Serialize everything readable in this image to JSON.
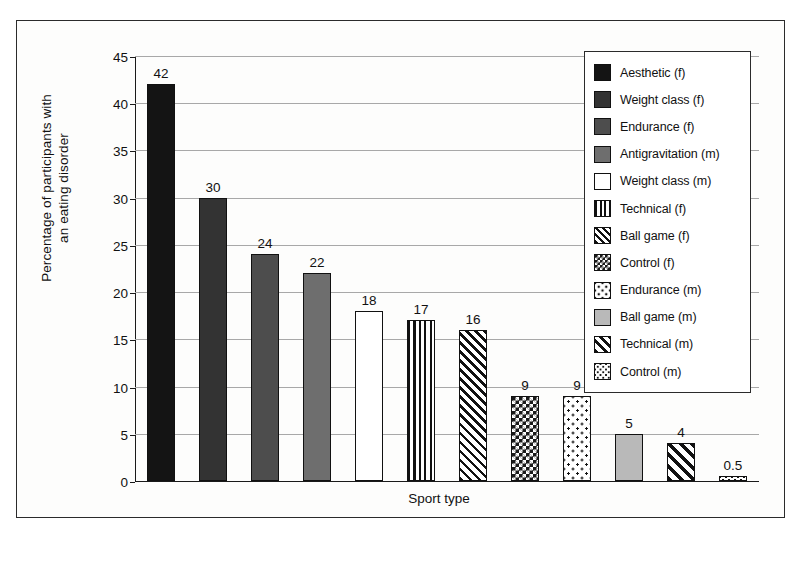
{
  "chart_data": {
    "type": "bar",
    "title": "",
    "xlabel": "Sport type",
    "ylabel": "Percentage of participants with\nan eating disorder",
    "ylim": [
      0,
      45
    ],
    "ytick_step": 5,
    "yticks": [
      0,
      5,
      10,
      15,
      20,
      25,
      30,
      35,
      40,
      45
    ],
    "grid": true,
    "legend_position": "top-right-inside",
    "categories": [
      "Aesthetic (f)",
      "Weight class (f)",
      "Endurance (f)",
      "Antigravitation (m)",
      "Weight class (m)",
      "Technical (f)",
      "Ball game (f)",
      "Control (f)",
      "Endurance (m)",
      "Ball game (m)",
      "Technical (m)",
      "Control (m)"
    ],
    "values": [
      42,
      30,
      24,
      22,
      18,
      17,
      16,
      9,
      9,
      5,
      4,
      0.5
    ],
    "value_labels": [
      "42",
      "30",
      "24",
      "22",
      "18",
      "17",
      "16",
      "9",
      "9",
      "5",
      "4",
      "0.5"
    ],
    "patterns": [
      "solid-black",
      "solid-darkgray",
      "solid-midgray",
      "solid-gray",
      "solid-white",
      "vertical-stripe",
      "diagonal-fine",
      "checker-dense",
      "dots-sparse",
      "solid-lightgray",
      "diagonal-coarse",
      "dots-fine"
    ]
  },
  "legend": {
    "items": [
      {
        "label": "Aesthetic (f)",
        "pattern": "solid-black"
      },
      {
        "label": "Weight class (f)",
        "pattern": "solid-darkgray"
      },
      {
        "label": "Endurance (f)",
        "pattern": "solid-midgray"
      },
      {
        "label": "Antigravitation (m)",
        "pattern": "solid-gray"
      },
      {
        "label": "Weight class (m)",
        "pattern": "solid-white"
      },
      {
        "label": "Technical (f)",
        "pattern": "vertical-stripe"
      },
      {
        "label": "Ball game (f)",
        "pattern": "diagonal-fine"
      },
      {
        "label": "Control (f)",
        "pattern": "checker-dense"
      },
      {
        "label": "Endurance (m)",
        "pattern": "dots-sparse"
      },
      {
        "label": "Ball game (m)",
        "pattern": "solid-lightgray"
      },
      {
        "label": "Technical (m)",
        "pattern": "diagonal-coarse"
      },
      {
        "label": "Control (m)",
        "pattern": "dots-fine"
      }
    ]
  },
  "colors": {
    "frame": "#2b2b2b",
    "axis": "#1a1a1a",
    "gridline": "#a8a8a8",
    "text": "#111111",
    "background": "#ffffff"
  }
}
